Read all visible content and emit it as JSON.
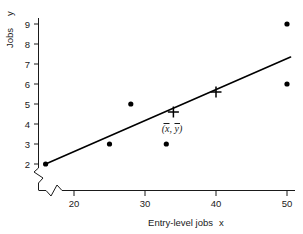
{
  "chart_data": {
    "type": "scatter",
    "title": "",
    "xlabel": "Entry-level jobs  x",
    "xlabel_text": "Entry-level jobs",
    "xlabel_var": "x",
    "ylabel": "Jobs  y",
    "ylabel_text": "Jobs",
    "ylabel_var": "y",
    "xlim": [
      14,
      52
    ],
    "ylim": [
      1.55,
      9.6
    ],
    "xticks": [
      20,
      30,
      40,
      50
    ],
    "yticks": [
      2,
      3,
      4,
      5,
      6,
      7,
      8,
      9
    ],
    "xtick_labels": [
      "20",
      "30",
      "40",
      "50"
    ],
    "ytick_labels": [
      "2",
      "3",
      "4",
      "5",
      "6",
      "7",
      "8",
      "9"
    ],
    "grid": false,
    "legend": "none",
    "axis_break_x": true,
    "axis_break_y": true,
    "points": [
      {
        "x": 16,
        "y": 2
      },
      {
        "x": 25,
        "y": 3
      },
      {
        "x": 28,
        "y": 5
      },
      {
        "x": 33,
        "y": 3
      },
      {
        "x": 50,
        "y": 6
      },
      {
        "x": 50,
        "y": 9
      }
    ],
    "crosses": [
      {
        "x": 34,
        "y": 4.6,
        "label": "(x̄, ȳ)"
      },
      {
        "x": 40,
        "y": 5.6,
        "label": ""
      }
    ],
    "fit_line": {
      "x0": 16,
      "y0": 2.0,
      "x1": 50.5,
      "y1": 7.35
    },
    "annotations": [
      {
        "text": "(x̄, ȳ)",
        "x": 34.6,
        "y": 4.05
      }
    ],
    "colors": {
      "point": "#000000",
      "line": "#000000",
      "axis": "#1a1a1a",
      "background": "#ffffff"
    }
  },
  "axes": {
    "x_title_main": "Entry-level jobs",
    "x_title_var": "x",
    "y_title_main": "Jobs",
    "y_title_var": "y"
  },
  "annotation": {
    "mean_point_label_open": "(",
    "mean_point_label_x": "x",
    "mean_point_label_sep": ", ",
    "mean_point_label_y": "y",
    "mean_point_label_close": ")"
  }
}
